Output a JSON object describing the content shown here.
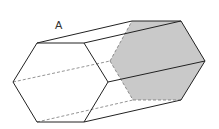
{
  "diagram": {
    "labels": [
      {
        "id": "A",
        "text": "A",
        "x": 55,
        "y": 29
      }
    ],
    "colors": {
      "stroke": "#222222",
      "hidden_stroke": "#666666",
      "shaded_face": "#c9c9c9",
      "background": "#ffffff"
    },
    "front_hexagon": [
      [
        37,
        43
      ],
      [
        84,
        43
      ],
      [
        108,
        82
      ],
      [
        84,
        122
      ],
      [
        37,
        122
      ],
      [
        13,
        82
      ]
    ],
    "back_hexagon": [
      [
        132,
        21
      ],
      [
        181,
        21
      ],
      [
        205,
        61
      ],
      [
        181,
        100
      ],
      [
        133,
        100
      ],
      [
        110,
        61
      ]
    ]
  }
}
